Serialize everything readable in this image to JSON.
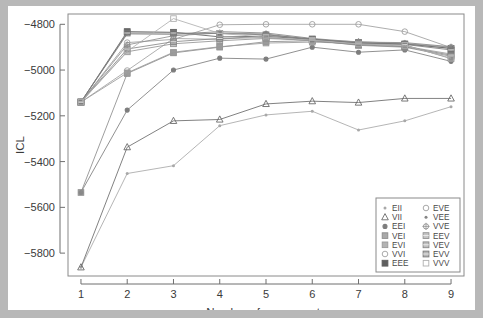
{
  "figure": {
    "background_color": "#b8b8b8",
    "canvas_color": "#ffffff",
    "panel_border_color": "#8a8a8a"
  },
  "chart_data": {
    "type": "line",
    "title": "",
    "subtitle": "",
    "xlabel": "Number of components",
    "ylabel": "ICL",
    "x": [
      1,
      2,
      3,
      4,
      5,
      6,
      7,
      8,
      9
    ],
    "xtick_labels": [
      "1",
      "2",
      "3",
      "4",
      "5",
      "6",
      "7",
      "8",
      "9"
    ],
    "ytick_labels": [
      "-4800",
      "-5000",
      "-5200",
      "-5400",
      "-5600",
      "-5800"
    ],
    "ytick_values": [
      -4800,
      -5000,
      -5200,
      -5400,
      -5600,
      -5800
    ],
    "xlim": [
      0.72,
      9.28
    ],
    "ylim": [
      -5900,
      -4755
    ],
    "grid": false,
    "legend_position": "bottom-right",
    "legend_columns": 2,
    "series": [
      {
        "name": "EII",
        "symbol": "dot",
        "color": "#a8a8a8",
        "values": [
          -5862,
          -5452,
          -5418,
          -5243,
          -5196,
          -5180,
          -5262,
          -5222,
          -5160
        ]
      },
      {
        "name": "VII",
        "symbol": "triangle-open",
        "color": "#6a6a6a",
        "values": [
          -5862,
          -5337,
          -5222,
          -5216,
          -5148,
          -5136,
          -5142,
          -5124,
          -5124
        ]
      },
      {
        "name": "EEI",
        "symbol": "dot-dark",
        "color": "#7d7d7d",
        "values": [
          -5535,
          -5175,
          -5000,
          -4948,
          -4952,
          -4900,
          -4922,
          -4912,
          -4962
        ]
      },
      {
        "name": "VEI",
        "symbol": "square-filled",
        "color": "#8c8c8c",
        "values": [
          -5535,
          -5015,
          -4925,
          -4900,
          -4876,
          -4872,
          -4888,
          -4890,
          -4950
        ]
      },
      {
        "name": "EVI",
        "symbol": "square-filled",
        "color": "#9a9a9a",
        "values": [
          -5140,
          -5012,
          -4922,
          -4898,
          -4882,
          -4878,
          -4884,
          -4896,
          -4930
        ]
      },
      {
        "name": "VVI",
        "symbol": "circle-open",
        "color": "#a0a0a0",
        "values": [
          -5140,
          -5002,
          -4862,
          -4866,
          -4848,
          -4866,
          -4884,
          -4884,
          -4906
        ]
      },
      {
        "name": "EEE",
        "symbol": "square-dark",
        "color": "#5e5e5e",
        "values": [
          -5140,
          -4832,
          -4835,
          -4855,
          -4853,
          -4866,
          -4880,
          -4886,
          -4905
        ]
      },
      {
        "name": "EVE",
        "symbol": "circle-open-2",
        "color": "#9e9e9e",
        "values": [
          -5140,
          -4880,
          -4866,
          -4802,
          -4800,
          -4800,
          -4800,
          -4832,
          -4902
        ]
      },
      {
        "name": "VEE",
        "symbol": "dot-mid",
        "color": "#858585",
        "values": [
          -5140,
          -4842,
          -4844,
          -4832,
          -4838,
          -4862,
          -4878,
          -4880,
          -4898
        ]
      },
      {
        "name": "VVE",
        "symbol": "plus-circle",
        "color": "#8f8f8f",
        "values": [
          -5140,
          -4890,
          -4850,
          -4838,
          -4842,
          -4868,
          -4876,
          -4884,
          -4900
        ]
      },
      {
        "name": "EEV",
        "symbol": "square-grid",
        "color": "#939393",
        "values": [
          -5140,
          -4920,
          -4885,
          -4872,
          -4862,
          -4870,
          -4892,
          -4900,
          -4940
        ]
      },
      {
        "name": "VEV",
        "symbol": "square-grid-2",
        "color": "#888888",
        "values": [
          -5140,
          -4908,
          -4876,
          -4862,
          -4858,
          -4872,
          -4890,
          -4898,
          -4935
        ]
      },
      {
        "name": "EVV",
        "symbol": "square-hatch",
        "color": "#7a7a7a",
        "values": [
          -5140,
          -4838,
          -4838,
          -4840,
          -4846,
          -4864,
          -4882,
          -4888,
          -4912
        ]
      },
      {
        "name": "VVV",
        "symbol": "square-open",
        "color": "#b0b0b0",
        "values": [
          -5140,
          -4918,
          -4775,
          -4840,
          -4856,
          -4870,
          -4886,
          -4892,
          -4948
        ]
      }
    ]
  },
  "legend": {
    "entries": [
      {
        "label": "EII"
      },
      {
        "label": "EVE"
      },
      {
        "label": "VII"
      },
      {
        "label": "VEE"
      },
      {
        "label": "EEI"
      },
      {
        "label": "VVE"
      },
      {
        "label": "VEI"
      },
      {
        "label": "EEV"
      },
      {
        "label": "EVI"
      },
      {
        "label": "VEV"
      },
      {
        "label": "VVI"
      },
      {
        "label": "EVV"
      },
      {
        "label": "EEE"
      },
      {
        "label": "VVV"
      }
    ]
  }
}
